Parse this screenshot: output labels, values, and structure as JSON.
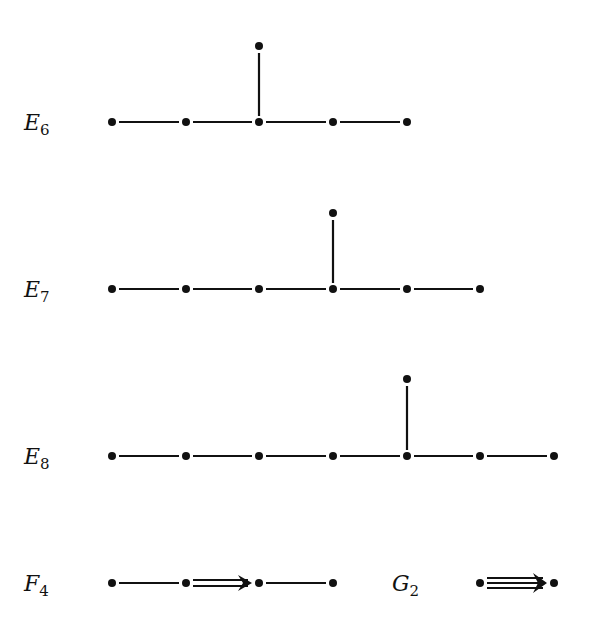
{
  "node_x": [
    112,
    186,
    259,
    333,
    407,
    480,
    554
  ],
  "diagrams": [
    {
      "name": "E6",
      "label_main": "E",
      "label_sub": "6",
      "row_y": 122,
      "label_x": 24,
      "chain_nodes": 5,
      "branch_at": 2,
      "branch_y": 46
    },
    {
      "name": "E7",
      "label_main": "E",
      "label_sub": "7",
      "row_y": 289,
      "label_x": 24,
      "chain_nodes": 6,
      "branch_at": 3,
      "branch_y": 213
    },
    {
      "name": "E8",
      "label_main": "E",
      "label_sub": "8",
      "row_y": 456,
      "label_x": 24,
      "chain_nodes": 7,
      "branch_at": 4,
      "branch_y": 379
    },
    {
      "name": "F4",
      "label_main": "F",
      "label_sub": "4",
      "row_y": 583,
      "label_x": 24,
      "nodes_x": [
        112,
        186,
        259,
        333
      ],
      "edges": [
        {
          "from": 0,
          "to": 1,
          "multiplicity": 1
        },
        {
          "from": 1,
          "to": 2,
          "multiplicity": 2,
          "arrow": "right"
        },
        {
          "from": 2,
          "to": 3,
          "multiplicity": 1
        }
      ]
    },
    {
      "name": "G2",
      "label_main": "G",
      "label_sub": "2",
      "row_y": 583,
      "label_x": 392,
      "nodes_x": [
        480,
        554
      ],
      "edges": [
        {
          "from": 0,
          "to": 1,
          "multiplicity": 3,
          "arrow": "right"
        }
      ]
    }
  ],
  "colors": {
    "ink": "#111111",
    "background": "#ffffff"
  }
}
